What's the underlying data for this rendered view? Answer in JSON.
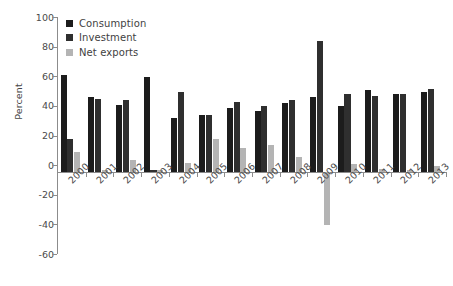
{
  "chart_data": {
    "type": "bar",
    "title": "",
    "xlabel": "",
    "ylabel": "Percent",
    "ylim": [
      -60,
      100
    ],
    "yticks": [
      100,
      80,
      60,
      40,
      20,
      0,
      -20,
      -40,
      -60
    ],
    "grid": false,
    "legend_position": "top-left",
    "categories": [
      "2000",
      "2001",
      "2002",
      "2003",
      "2004",
      "2005",
      "2006",
      "2007",
      "2008",
      "2009",
      "2010",
      "2011",
      "2012",
      "2013"
    ],
    "series": [
      {
        "name": "Consumption",
        "color": "#1c1c1c",
        "values": [
          65,
          50,
          45,
          64,
          36,
          38,
          43,
          41,
          46,
          50,
          44,
          55,
          52,
          54
        ]
      },
      {
        "name": "Investment",
        "color": "#2f2f2f",
        "values": [
          22,
          49,
          48,
          1,
          54,
          38,
          47,
          44,
          48,
          88,
          52,
          51,
          52,
          56
        ]
      },
      {
        "name": "Net exports",
        "color": "#b4b4b4",
        "values": [
          13,
          1,
          8,
          1,
          6,
          22,
          16,
          18,
          10,
          -36,
          5,
          2,
          1,
          4
        ]
      }
    ]
  },
  "legend": {
    "items": [
      {
        "label": "Consumption",
        "color": "#1c1c1c",
        "swatch": "square-icon"
      },
      {
        "label": "Investment",
        "color": "#2f2f2f",
        "swatch": "square-icon"
      },
      {
        "label": "Net exports",
        "color": "#b4b4b4",
        "swatch": "square-icon"
      }
    ]
  },
  "caption": {
    "text": ""
  }
}
